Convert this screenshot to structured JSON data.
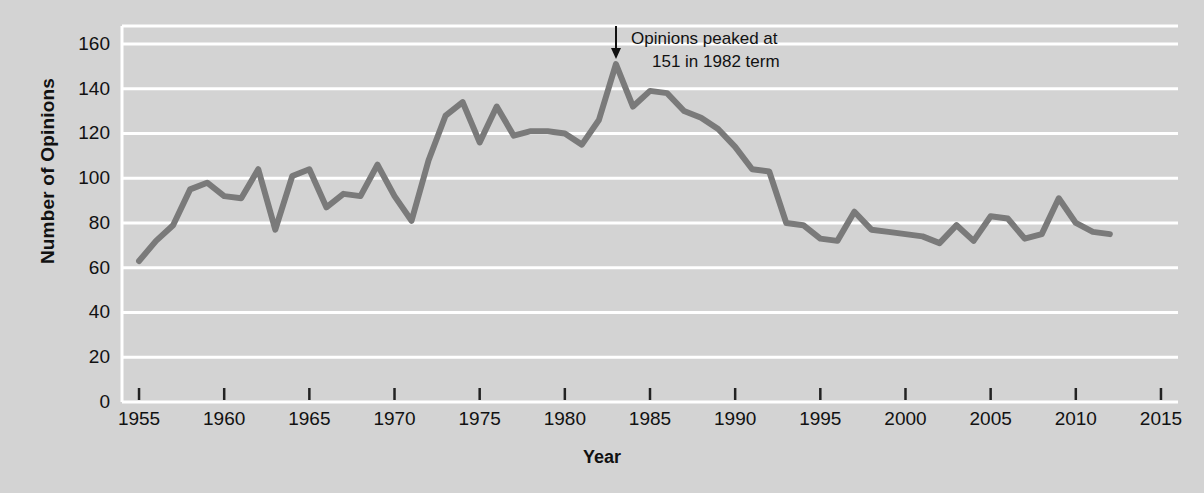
{
  "chart_data": {
    "type": "line",
    "title": "",
    "xlabel": "Year",
    "ylabel": "Number of Opinions",
    "xlim": [
      1954,
      2016
    ],
    "ylim": [
      0,
      168
    ],
    "xticks": [
      1955,
      1960,
      1965,
      1970,
      1975,
      1980,
      1985,
      1990,
      1995,
      2000,
      2005,
      2010,
      2015
    ],
    "yticks": [
      0,
      20,
      40,
      60,
      80,
      100,
      120,
      140,
      160
    ],
    "grid": "horizontal",
    "legend": "none",
    "line_color": "#7a7a7a",
    "background_color": "#d3d3d3",
    "gridline_color": "#ffffff",
    "annotations": [
      {
        "text_line1": "Opinions peaked at",
        "text_line2": "151 in 1982 term",
        "arrow": "down-arrow",
        "points_to_year": 1983,
        "points_to_value": 151
      }
    ],
    "x": [
      1955,
      1956,
      1957,
      1958,
      1959,
      1960,
      1961,
      1962,
      1963,
      1964,
      1965,
      1966,
      1967,
      1968,
      1969,
      1970,
      1971,
      1972,
      1973,
      1974,
      1975,
      1976,
      1977,
      1978,
      1979,
      1980,
      1981,
      1982,
      1983,
      1984,
      1985,
      1986,
      1987,
      1988,
      1989,
      1990,
      1991,
      1992,
      1993,
      1994,
      1995,
      1996,
      1997,
      1998,
      1999,
      2000,
      2001,
      2002,
      2003,
      2004,
      2005,
      2006,
      2007,
      2008,
      2009,
      2010,
      2011,
      2012
    ],
    "values": [
      63,
      72,
      79,
      95,
      98,
      92,
      91,
      104,
      77,
      101,
      104,
      87,
      93,
      92,
      106,
      92,
      81,
      108,
      128,
      134,
      116,
      132,
      119,
      121,
      121,
      120,
      115,
      126,
      151,
      132,
      139,
      138,
      130,
      127,
      122,
      114,
      104,
      103,
      80,
      79,
      73,
      72,
      85,
      77,
      76,
      75,
      74,
      71,
      79,
      72,
      83,
      82,
      73,
      75,
      91,
      80,
      76,
      75
    ]
  },
  "axis": {
    "y_title": "Number of Opinions",
    "x_title": "Year"
  }
}
